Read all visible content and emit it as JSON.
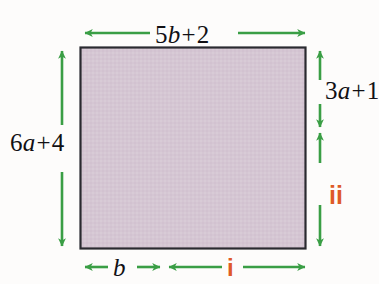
{
  "figure": {
    "type": "geometry-diagram",
    "shape": "rectangle",
    "background_color": "#fdfcfb",
    "rectangle": {
      "fill_color": "#d5c6d3",
      "border_color": "#2a2a30"
    },
    "arrow_color": "#3a9e45",
    "marker_color": "#df5a27",
    "text_color": "#111014",
    "labels": {
      "top": {
        "name": "top-dimension",
        "coefficient": "5",
        "variable": "b",
        "operator": "+",
        "constant": "2",
        "full": "5b + 2"
      },
      "left": {
        "name": "left-dimension",
        "coefficient": "6",
        "variable": "a",
        "operator": "+",
        "constant": "4",
        "full": "6a + 4"
      },
      "right_upper": {
        "name": "right-upper-dimension",
        "coefficient": "3",
        "variable": "a",
        "operator": "+",
        "constant": "1",
        "full": "3a + 1"
      },
      "right_lower": {
        "name": "right-lower-marker",
        "text": "ii"
      },
      "bottom_left": {
        "name": "bottom-left-dimension",
        "variable": "b",
        "full": "b"
      },
      "bottom_right": {
        "name": "bottom-right-marker",
        "text": "i"
      }
    }
  }
}
